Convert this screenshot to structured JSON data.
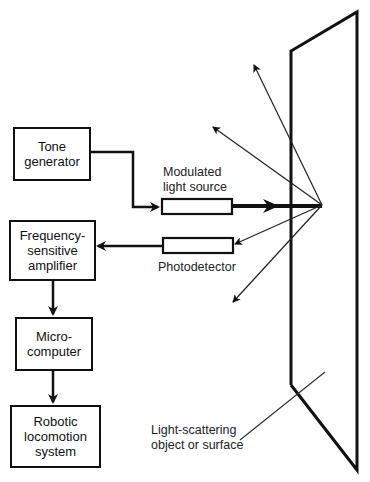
{
  "diagram": {
    "blocks": [
      {
        "id": "tone",
        "label": "Tone\ngenerator"
      },
      {
        "id": "freq",
        "label": "Frequency-\nsensitive\namplifier"
      },
      {
        "id": "micro",
        "label": "Micro-\ncomputer"
      },
      {
        "id": "robot",
        "label": "Robotic\nlocomotion\nsystem"
      }
    ],
    "components": {
      "source": "Modulated\nlight source",
      "detector": "Photodetector",
      "surface": "Light-scattering\nobject or surface"
    },
    "colors": {
      "stroke": "#111111",
      "background": "#ffffff"
    }
  }
}
